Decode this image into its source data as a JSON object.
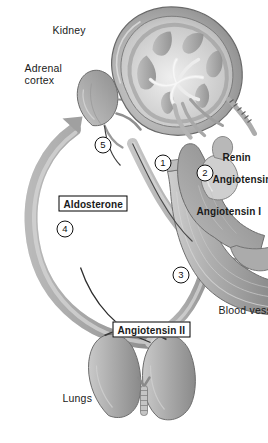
{
  "figure": {
    "background_color": "#ffffff",
    "orientation": "rotated-90",
    "palette": {
      "organ_light": "#d9d9d9",
      "organ_mid": "#a8a8a8",
      "organ_dark": "#7d7d7d",
      "outline": "#5a5a5a",
      "text": "#1a1a1a",
      "arrow": "#b3b3b3"
    }
  },
  "organ_labels": {
    "lungs": "Lungs",
    "adrenal_cortex": "Adrenal\ncortex",
    "adrenal_cortex_line1": "Adrenal",
    "adrenal_cortex_line2": "cortex",
    "kidney": "Kidney",
    "blood_vessel": "Blood vessel"
  },
  "substance_labels": {
    "angiotensin_ii": "Angiotensin II",
    "aldosterone": "Aldosterone",
    "angiotensin_i": "Angiotensin I",
    "angiotensinogen": "Angiotensinogen",
    "renin": "Renin"
  },
  "steps": [
    {
      "id": 1,
      "marker": "1"
    },
    {
      "id": 2,
      "marker": "2"
    },
    {
      "id": 3,
      "marker": "3"
    },
    {
      "id": 4,
      "marker": "4"
    },
    {
      "id": 5,
      "marker": "5"
    }
  ]
}
